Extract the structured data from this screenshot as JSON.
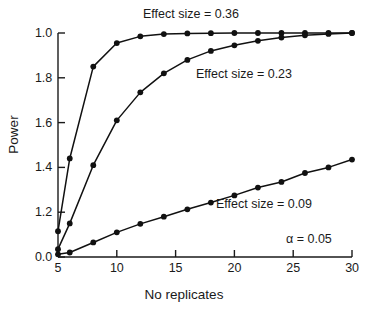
{
  "figure": {
    "width": 368,
    "height": 313,
    "background": "#ffffff",
    "ink_color": "#1a1a1a"
  },
  "axes": {
    "xlabel": "No replicates",
    "ylabel": "Power",
    "xticks": [
      "5",
      "10",
      "15",
      "20",
      "25",
      "30"
    ],
    "yticks": [
      "1.0",
      "1.8",
      "1.6",
      "1.4",
      "1.2",
      "0.0"
    ]
  },
  "annotations": {
    "curve_036": "Effect size = 0.36",
    "curve_023": "Effect size = 0.23",
    "curve_009": "Effect size = 0.09",
    "alpha": "α = 0.05"
  },
  "chart_data": {
    "type": "line",
    "title": "",
    "xlabel": "No replicates",
    "ylabel": "Power",
    "xlim": [
      5,
      30
    ],
    "ylim": [
      0.0,
      1.0
    ],
    "xticks": [
      5,
      10,
      15,
      20,
      25,
      30
    ],
    "ytick_values": [
      1.0,
      0.8,
      0.6,
      0.4,
      0.2,
      0.0
    ],
    "ytick_labels_as_printed": [
      "1.0",
      "1.8",
      "1.6",
      "1.4",
      "1.2",
      "0.0"
    ],
    "grid": false,
    "legend": "inline-annotations",
    "marker": "filled-circle",
    "line_color": "#111111",
    "annotations": [
      {
        "text": "Effect size = 0.36",
        "x": 12.5,
        "y": 1.07
      },
      {
        "text": "Effect size = 0.23",
        "x": 17.2,
        "y": 0.8
      },
      {
        "text": "Effect size = 0.09",
        "x": 19.0,
        "y": 0.22
      },
      {
        "text": "α = 0.05",
        "x": 25.5,
        "y": 0.075
      }
    ],
    "series": [
      {
        "name": "Effect size = 0.36",
        "effect_size": 0.36,
        "x": [
          5,
          6,
          8,
          10,
          12,
          14,
          16,
          18,
          20,
          22,
          24,
          26,
          28,
          30
        ],
        "values": [
          0.115,
          0.44,
          0.85,
          0.955,
          0.985,
          0.995,
          0.998,
          0.999,
          1.0,
          1.0,
          1.0,
          1.0,
          1.0,
          1.0
        ]
      },
      {
        "name": "Effect size = 0.23",
        "effect_size": 0.23,
        "x": [
          5,
          6,
          8,
          10,
          12,
          14,
          16,
          18,
          20,
          22,
          24,
          26,
          28,
          30
        ],
        "values": [
          0.035,
          0.15,
          0.41,
          0.61,
          0.735,
          0.82,
          0.88,
          0.92,
          0.945,
          0.965,
          0.98,
          0.99,
          0.996,
          1.0
        ]
      },
      {
        "name": "Effect size = 0.09",
        "effect_size": 0.09,
        "x": [
          5,
          6,
          8,
          10,
          12,
          14,
          16,
          18,
          20,
          22,
          24,
          26,
          28,
          30
        ],
        "values": [
          0.012,
          0.02,
          0.065,
          0.11,
          0.148,
          0.18,
          0.213,
          0.243,
          0.275,
          0.31,
          0.335,
          0.375,
          0.4,
          0.435
        ]
      }
    ]
  }
}
